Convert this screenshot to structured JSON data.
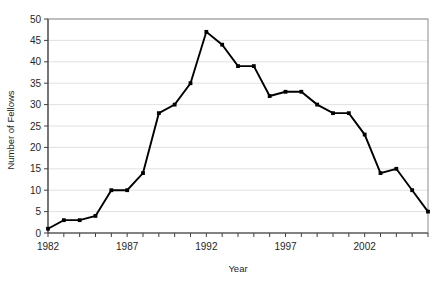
{
  "chart_data": {
    "type": "line",
    "title": "",
    "xlabel": "Year",
    "ylabel": "Number of Fellows",
    "xlim": [
      1982,
      2006
    ],
    "ylim": [
      0,
      50
    ],
    "ytick_step": 5,
    "yticks": [
      0,
      5,
      10,
      15,
      20,
      25,
      30,
      35,
      40,
      45,
      50
    ],
    "ytick_labels": [
      "0",
      "5",
      "10",
      "15",
      "20",
      "25",
      "30",
      "35",
      "40",
      "45",
      "50"
    ],
    "xticks": [
      1982,
      1983,
      1984,
      1985,
      1986,
      1987,
      1988,
      1989,
      1990,
      1991,
      1992,
      1993,
      1994,
      1995,
      1996,
      1997,
      1998,
      1999,
      2000,
      2001,
      2002,
      2003,
      2004,
      2005,
      2006
    ],
    "xtick_labels_shown": [
      "1982",
      "1987",
      "1992",
      "1997",
      "2002"
    ],
    "xtick_label_years": [
      1982,
      1987,
      1992,
      1997,
      2002
    ],
    "grid": "horizontal",
    "legend": "none",
    "marker": "filled-square",
    "x": [
      1982,
      1983,
      1984,
      1985,
      1986,
      1987,
      1988,
      1989,
      1990,
      1991,
      1992,
      1993,
      1994,
      1995,
      1996,
      1997,
      1998,
      1999,
      2000,
      2001,
      2002,
      2003,
      2004,
      2005,
      2006
    ],
    "values": [
      1,
      3,
      3,
      4,
      10,
      10,
      14,
      28,
      30,
      35,
      47,
      44,
      39,
      39,
      32,
      33,
      33,
      30,
      28,
      28,
      23,
      14,
      15,
      10,
      5
    ],
    "series": [
      {
        "name": "Number of Fellows",
        "color": "#000000",
        "values": [
          1,
          3,
          3,
          4,
          10,
          10,
          14,
          28,
          30,
          35,
          47,
          44,
          39,
          39,
          32,
          33,
          33,
          30,
          28,
          28,
          23,
          14,
          15,
          10,
          5
        ]
      }
    ]
  },
  "colors": {
    "line": "#000000",
    "grid": "#d9d9d9",
    "frame": "#8c8c8c",
    "axis": "#404040",
    "text": "#262626",
    "background": "#ffffff"
  }
}
